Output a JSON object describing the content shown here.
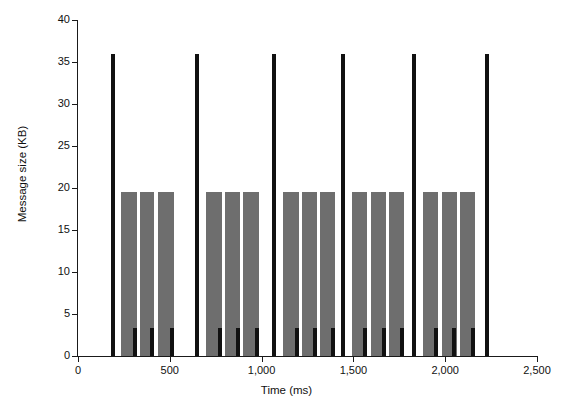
{
  "chart_data": {
    "type": "bar",
    "title": "",
    "subtitle": "",
    "xlabel": "Time (ms)",
    "ylabel": "Message size (KB)",
    "xlim": [
      0,
      2500
    ],
    "ylim": [
      0,
      40
    ],
    "grid": false,
    "legend": null,
    "annotations": [],
    "xticks": [
      0,
      500,
      1000,
      1500,
      2000,
      2500
    ],
    "xtick_labels": [
      "0",
      "500",
      "1,000",
      "1,500",
      "2,000",
      "2,500"
    ],
    "yticks": [
      0,
      5,
      10,
      15,
      20,
      25,
      30,
      35,
      40
    ],
    "ytick_labels": [
      "0",
      "5",
      "10",
      "15",
      "20",
      "25",
      "30",
      "35",
      "40"
    ],
    "levels": {
      "large_kb": 36,
      "medium_kb": 19.5,
      "small_kb": 3.3
    },
    "series": [
      {
        "name": "Large messages (36 KB)",
        "value_kb": 36,
        "color": "#111111",
        "bar_width_px": 4,
        "x": [
          190,
          648,
          1068,
          1443,
          1830,
          2228
        ]
      },
      {
        "name": "Medium messages (19.5 KB)",
        "value_kb": 19.5,
        "color": "#6e6e6e",
        "bar_width_px": 1.6,
        "x": [
          241,
          247,
          253,
          259,
          265,
          271,
          277,
          283,
          289,
          295,
          301,
          307,
          313,
          319,
          344,
          350,
          356,
          362,
          368,
          374,
          380,
          386,
          392,
          398,
          404,
          410,
          441,
          447,
          453,
          459,
          465,
          471,
          477,
          483,
          489,
          495,
          501,
          507,
          513,
          519,
          702,
          708,
          714,
          720,
          726,
          732,
          738,
          744,
          750,
          756,
          762,
          768,
          774,
          780,
          806,
          812,
          818,
          824,
          830,
          836,
          842,
          848,
          854,
          860,
          866,
          872,
          878,
          905,
          911,
          917,
          923,
          929,
          935,
          941,
          947,
          953,
          959,
          965,
          971,
          977,
          983,
          1122,
          1128,
          1134,
          1140,
          1146,
          1152,
          1158,
          1164,
          1170,
          1176,
          1182,
          1188,
          1194,
          1200,
          1226,
          1232,
          1238,
          1244,
          1250,
          1256,
          1262,
          1268,
          1274,
          1280,
          1286,
          1292,
          1298,
          1325,
          1331,
          1337,
          1343,
          1349,
          1355,
          1361,
          1367,
          1373,
          1379,
          1385,
          1391,
          1397,
          1497,
          1503,
          1509,
          1515,
          1521,
          1527,
          1533,
          1539,
          1545,
          1551,
          1557,
          1563,
          1569,
          1600,
          1606,
          1612,
          1618,
          1624,
          1630,
          1636,
          1642,
          1648,
          1654,
          1660,
          1666,
          1672,
          1700,
          1706,
          1712,
          1718,
          1724,
          1730,
          1736,
          1742,
          1748,
          1754,
          1760,
          1766,
          1772,
          1884,
          1890,
          1896,
          1902,
          1908,
          1914,
          1920,
          1926,
          1932,
          1938,
          1944,
          1950,
          1956,
          1986,
          1992,
          1998,
          2004,
          2010,
          2016,
          2022,
          2028,
          2034,
          2040,
          2046,
          2052,
          2058,
          2086,
          2092,
          2098,
          2104,
          2110,
          2116,
          2122,
          2128,
          2134,
          2140,
          2146,
          2152,
          2158
        ]
      },
      {
        "name": "Small messages (3.3 KB)",
        "value_kb": 3.3,
        "color": "#111111",
        "bar_width_px": 4,
        "x": [
          310,
          404,
          512,
          772,
          870,
          975,
          1192,
          1290,
          1389,
          1561,
          1664,
          1764,
          1948,
          2050,
          2150
        ]
      }
    ]
  }
}
